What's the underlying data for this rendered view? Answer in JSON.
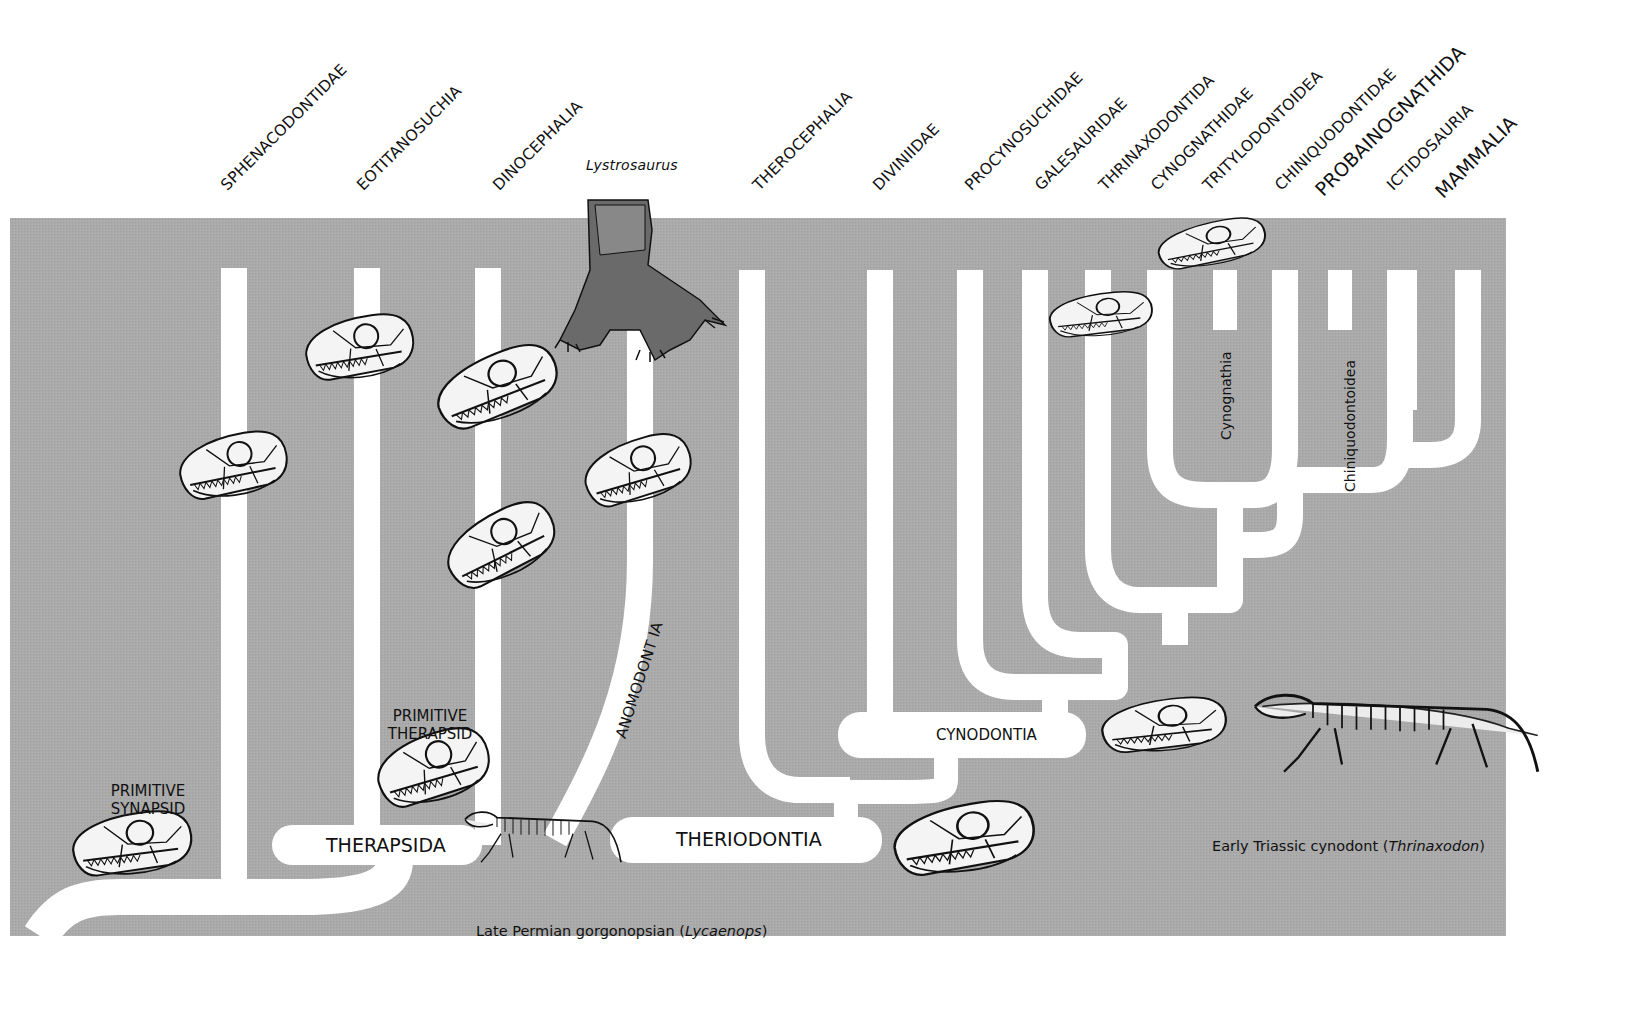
{
  "diagram": {
    "colors": {
      "background": "#a9a9a9",
      "branch": "#ffffff",
      "text": "#111111",
      "page": "#ffffff"
    },
    "top_labels": [
      "SPHENACODONTIDAE",
      "EOTITANOSUCHIA",
      "DINOCEPHALIA",
      "Lystrosaurus",
      "THEROCEPHALIA",
      "DIVINIIDAE",
      "PROCYNOSUCHIDAE",
      "GALESAURIDAE",
      "THRINAXODONTIDA",
      "CYNOGNATHIDAE",
      "TRITYLODONTOIDEA",
      "CHINIQUODONTIDAE",
      "PROBAINOGNATHIDA",
      "ICTIDOSAURIA",
      "MAMMALIA"
    ],
    "clade_labels": {
      "therapsida": "THERAPSIDA",
      "theriodontia": "THERIODONTIA",
      "cynodontia": "CYNODONTIA",
      "anomodontia": "ANOMODONT IA",
      "cynognathia": "Cynognathia",
      "chiniquodontoidea": "Chiniquodontoidea"
    },
    "captions": {
      "primitive_synapsid": [
        "PRIMITIVE",
        "SYNAPSID"
      ],
      "primitive_therapsid": [
        "PRIMITIVE",
        "THERAPSID"
      ],
      "gorgonopsian_prefix": "Late Permian gorgonopsian (",
      "gorgonopsian_genus": "Lycaenops",
      "gorgonopsian_suffix": ")",
      "cynodont_prefix": "Early Triassic cynodont (",
      "cynodont_genus": "Thrinaxodon",
      "cynodont_suffix": ")"
    },
    "illustrations": [
      "sphenacodont-skull",
      "primitive-synapsid-skull",
      "eotitanosuchian-skull",
      "dinocephalian-skull-upper",
      "dinocephalian-skull-lower",
      "anomodont-skull",
      "lystrosaurus-drawing",
      "primitive-therapsid-skull",
      "lycaenops-skeleton",
      "theriodont-skull",
      "procynosuchid-skull",
      "cynognathid-skull",
      "cynodont-skull",
      "thrinaxodon-skeleton"
    ]
  }
}
